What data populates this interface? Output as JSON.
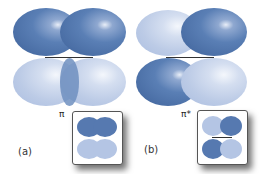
{
  "figure": {
    "panels": [
      {
        "id": "a",
        "caption": "(a)",
        "orbital_label": "π",
        "description": "bonding pi orbital",
        "top_lobes": [
          "dark",
          "dark"
        ],
        "bottom_lobes": [
          "light",
          "light"
        ]
      },
      {
        "id": "b",
        "caption": "(b)",
        "orbital_label": "π*",
        "description": "antibonding pi orbital",
        "top_lobes": [
          "light",
          "dark"
        ],
        "bottom_lobes": [
          "dark",
          "light"
        ]
      }
    ],
    "colors": {
      "dark_lobe": "#4a6ea5",
      "light_lobe": "#bccbe6",
      "bond_line": "#333333"
    }
  }
}
